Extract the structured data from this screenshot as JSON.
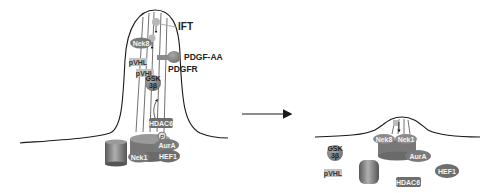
{
  "diagram": {
    "left_panel": {
      "labels": {
        "ift": "IFT",
        "pdgf_aa": "PDGF-AA",
        "pdgfr": "PDGFR"
      },
      "proteins": {
        "nek8": "Nek8",
        "pvhl_1": "pVHL",
        "pvhl_2": "pVHL",
        "gsk_line1": "GSK",
        "gsk_line2": "3β",
        "hdac6": "HDAC6",
        "phospho": "P",
        "aura": "AurA",
        "hef1": "HEF1",
        "nek1": "Nek1"
      }
    },
    "transition_arrow": "→",
    "right_panel": {
      "proteins": {
        "nek8": "Nek8",
        "nek1": "Nek1",
        "aura": "AurA",
        "gsk_line1": "GSK",
        "gsk_line2": "3β",
        "pvhl": "pVHL",
        "hef1": "HEF1",
        "hdac6": "HDAC6"
      }
    },
    "colors": {
      "line": "#1a1a1a",
      "protein_fill": "#8a8a8a",
      "protein_dark": "#6e6e6e",
      "label_light": "#bdbdbd"
    }
  }
}
